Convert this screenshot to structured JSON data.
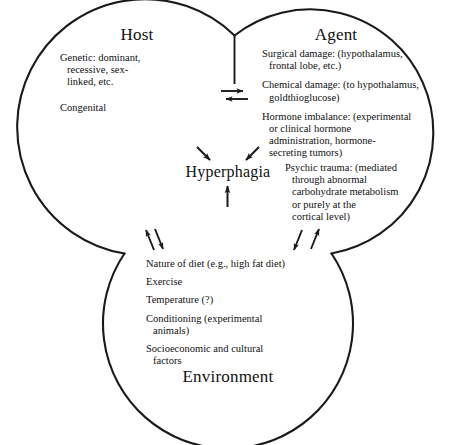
{
  "figure": {
    "type": "venn-three-circle-diagram",
    "center_label": "Hyperphagia",
    "stroke_color": "#1a1a1a",
    "background_color": "#ffffff"
  },
  "circles": {
    "host": {
      "title": "Host",
      "items": [
        {
          "lines": [
            "Genetic: dominant,",
            "recessive, sex-",
            "linked, etc."
          ]
        },
        {
          "lines": [
            "Congenital"
          ]
        }
      ]
    },
    "agent": {
      "title": "Agent",
      "items": [
        {
          "lines": [
            "Surgical damage: (hypothalamus,",
            "frontal lobe, etc.)"
          ]
        },
        {
          "lines": [
            "Chemical damage: (to hypothalamus,",
            "goldthioglucose)"
          ]
        },
        {
          "lines": [
            "Hormone imbalance: (experimental",
            "or clinical hormone",
            "administration, hormone-",
            "secreting tumors)"
          ]
        }
      ],
      "items_lower": [
        {
          "lines": [
            "Psychic trauma: (mediated",
            "through abnormal",
            "carbohydrate metabolism",
            "or purely at the",
            "cortical level)"
          ]
        }
      ]
    },
    "environment": {
      "title": "Environment",
      "items": [
        {
          "lines": [
            "Nature of diet (e.g., high fat diet)"
          ]
        },
        {
          "lines": [
            "Exercise"
          ]
        },
        {
          "lines": [
            "Temperature (?)"
          ]
        },
        {
          "lines": [
            "Conditioning (experimental",
            "animals)"
          ]
        },
        {
          "lines": [
            "Socioeconomic and cultural",
            "factors"
          ]
        }
      ]
    }
  },
  "connectors": {
    "host_agent": "bidirectional-horizontal-arrow-pair",
    "host_environment": "bidirectional-diagonal-arrow-pair",
    "agent_environment": "bidirectional-diagonal-arrow-pair",
    "to_center": [
      "arrow-from-host",
      "arrow-from-agent",
      "arrow-from-environment"
    ]
  }
}
